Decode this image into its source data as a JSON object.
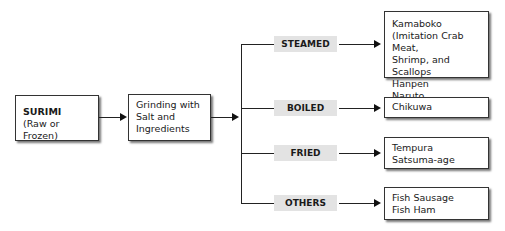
{
  "diagram": {
    "source": {
      "title": "SURIMI",
      "subtitle": "(Raw or Frozen)"
    },
    "process": {
      "lines": [
        "Grinding with",
        "Salt and",
        "Ingredients"
      ]
    },
    "branches": [
      {
        "label": "STEAMED",
        "products": [
          "Kamaboko",
          "(Imitation Crab Meat,",
          "Shrimp, and Scallops",
          "Hanpen",
          "Naruto"
        ]
      },
      {
        "label": "BOILED",
        "products": [
          "Chikuwa"
        ]
      },
      {
        "label": "FRIED",
        "products": [
          "Tempura",
          "Satsuma-age"
        ]
      },
      {
        "label": "OTHERS",
        "products": [
          "Fish Sausage",
          "Fish Ham"
        ]
      }
    ]
  }
}
